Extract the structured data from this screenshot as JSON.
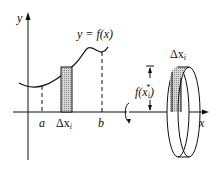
{
  "diagram": {
    "left_panel": {
      "y_axis_label": "y",
      "curve_label": "y = f(x)",
      "x_tick_labels": {
        "a": "a",
        "delta": "Δx",
        "delta_sub": "i",
        "b": "b"
      }
    },
    "right_panel": {
      "x_axis_label": "x",
      "height_label": "f(x",
      "height_label_sub": "i",
      "height_label_sup": "*",
      "height_label_close": ")",
      "width_label": "Δx",
      "width_label_sub": "i"
    },
    "colors": {
      "ink": "#111111",
      "shade": "#bdbdbd",
      "background": "#ffffff"
    }
  }
}
